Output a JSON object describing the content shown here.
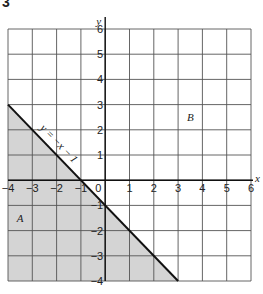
{
  "figure": {
    "label": "3"
  },
  "chart_data": {
    "type": "line",
    "title": "",
    "xlabel": "x",
    "ylabel": "y",
    "xlim": [
      -4,
      6
    ],
    "ylim": [
      -4,
      6
    ],
    "grid": true,
    "x_ticks": [
      -4,
      -3,
      -2,
      -1,
      0,
      1,
      2,
      3,
      4,
      5,
      6
    ],
    "y_ticks": [
      -4,
      -3,
      -2,
      -1,
      1,
      2,
      3,
      4,
      5,
      6
    ],
    "x_tick_labels": [
      "−4",
      "−3",
      "−2",
      "−1",
      "0",
      "1",
      "2",
      "3",
      "4",
      "5",
      "6"
    ],
    "y_tick_labels": [
      "−4",
      "−3",
      "−2",
      "−1",
      "1",
      "2",
      "3",
      "4",
      "5",
      "6"
    ],
    "series": [
      {
        "name": "y = −x − 1",
        "equation": "y = -x - 1",
        "points": [
          [
            -4,
            3
          ],
          [
            3,
            -4
          ]
        ]
      }
    ],
    "regions": [
      {
        "label": "A",
        "description": "shaded region below the line y = −x − 1",
        "shaded": true,
        "label_position": [
          -3.5,
          -1.5
        ]
      },
      {
        "label": "B",
        "description": "unshaded region above the line y = −x − 1",
        "shaded": false,
        "label_position": [
          3.5,
          2.5
        ]
      }
    ],
    "annotations": [
      {
        "text": "y = −x − 1",
        "position": "along the line, upper-left section"
      }
    ],
    "colors": {
      "grid": "#555555",
      "shade": "#d4d4d4",
      "line": "#111111"
    }
  }
}
